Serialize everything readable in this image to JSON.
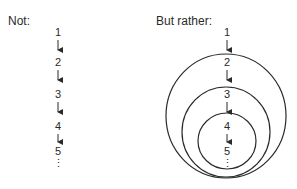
{
  "left": {
    "title": "Not:",
    "numbers": [
      "1",
      "2",
      "3",
      "4",
      "5"
    ],
    "ellipsis": "⋮"
  },
  "right": {
    "title": "But rather:",
    "numbers": [
      "1",
      "2",
      "3",
      "4",
      "5"
    ],
    "ellipsis": "⋮"
  },
  "colors": {
    "stroke": "#2a2a2a",
    "background": "#ffffff"
  }
}
